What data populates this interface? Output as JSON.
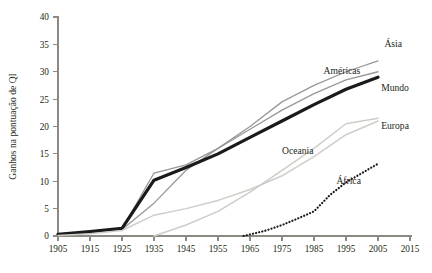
{
  "chart_data": {
    "type": "line",
    "title": "",
    "xlabel": "",
    "ylabel": "Ganhos na pontuação de QI",
    "xlim": [
      1905,
      2015
    ],
    "ylim": [
      0,
      40
    ],
    "grid": false,
    "legend_position": "inline-right",
    "x_ticks": [
      1905,
      1915,
      1925,
      1935,
      1945,
      1955,
      1965,
      1975,
      1985,
      1995,
      2005,
      2015
    ],
    "y_ticks": [
      0,
      5,
      10,
      15,
      20,
      25,
      30,
      35,
      40
    ],
    "series": [
      {
        "name": "Ásia",
        "color": "#9a9894",
        "style": "solid",
        "width": 1.3,
        "label_x": 2007,
        "label_y": 34.5,
        "x": [
          1905,
          1915,
          1925,
          1935,
          1945,
          1955,
          1965,
          1975,
          1985,
          1995,
          2005
        ],
        "values": [
          0.2,
          0.6,
          1.2,
          6.0,
          12.0,
          16.0,
          20.0,
          24.5,
          27.5,
          30.0,
          32.0
        ]
      },
      {
        "name": "Américas",
        "color": "#9a9894",
        "style": "solid",
        "width": 1.3,
        "label_x": 1988,
        "label_y": 29.5,
        "x": [
          1905,
          1915,
          1925,
          1935,
          1945,
          1955,
          1965,
          1975,
          1985,
          1995,
          2005
        ],
        "values": [
          0.2,
          0.7,
          1.3,
          11.5,
          13.0,
          16.0,
          19.5,
          23.0,
          26.0,
          28.5,
          30.0
        ]
      },
      {
        "name": "Mundo",
        "color": "#1a1a1a",
        "style": "solid",
        "width": 3.2,
        "label_x": 2006,
        "label_y": 26.5,
        "x": [
          1905,
          1915,
          1925,
          1935,
          1945,
          1955,
          1965,
          1975,
          1985,
          1995,
          2005
        ],
        "values": [
          0.3,
          0.8,
          1.4,
          10.2,
          12.5,
          15.0,
          18.0,
          21.0,
          24.0,
          26.8,
          29.0
        ]
      },
      {
        "name": "Europa",
        "color": "#cfcdc8",
        "style": "solid",
        "width": 1.5,
        "label_x": 2006,
        "label_y": 19.5,
        "x": [
          1905,
          1915,
          1925,
          1935,
          1945,
          1955,
          1965,
          1975,
          1985,
          1995,
          2005
        ],
        "values": [
          0.1,
          0.4,
          1.0,
          3.8,
          5.0,
          6.5,
          8.5,
          11.0,
          14.5,
          18.5,
          21.0
        ]
      },
      {
        "name": "Oceania",
        "color": "#cfcdc8",
        "style": "solid",
        "width": 1.5,
        "label_x": 1975,
        "label_y": 15.0,
        "x": [
          1935,
          1945,
          1955,
          1965,
          1975,
          1985,
          1995,
          2005
        ],
        "values": [
          0.0,
          2.0,
          4.5,
          8.0,
          12.0,
          16.0,
          20.5,
          21.5
        ]
      },
      {
        "name": "África",
        "color": "#1a1a1a",
        "style": "dotted",
        "width": 2.2,
        "label_x": 1992,
        "label_y": 9.5,
        "x": [
          1963,
          1970,
          1975,
          1980,
          1985,
          1990,
          1995,
          2000,
          2005
        ],
        "values": [
          0.0,
          1.0,
          2.0,
          3.2,
          4.5,
          7.5,
          9.8,
          11.5,
          13.2
        ]
      }
    ]
  },
  "axes": {
    "y_title": "Ganhos na pontuação de QI"
  }
}
